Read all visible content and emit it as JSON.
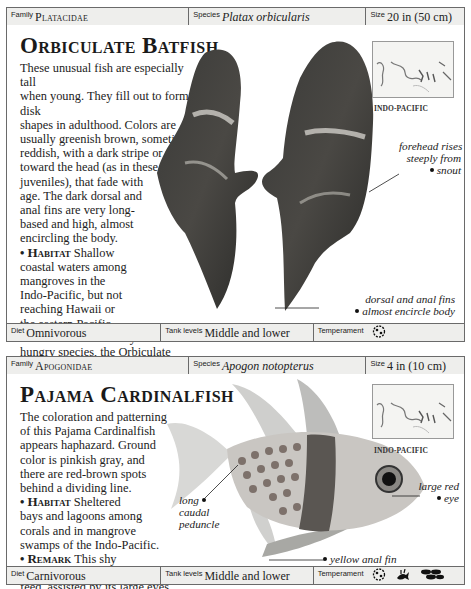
{
  "entries": [
    {
      "header": {
        "family_label": "Family",
        "family_value": "Platacidae",
        "species_label": "Species",
        "species_value": "Platax orbicularis",
        "size_label": "Size",
        "size_value": "20 in (50 cm)"
      },
      "title": "Orbiculate Batfish",
      "description": {
        "intro_lines": [
          "These unusual fish are especially tall",
          "when young. They fill out to form disk",
          "shapes in adulthood. Colors are",
          "usually greenish brown, sometimes",
          "reddish, with a dark stripe or two",
          "toward the head (as in these",
          "juveniles), that fade with",
          "age. The dark dorsal and",
          "anal fins are very long-",
          "based and high, almost",
          "encircling the body."
        ],
        "habitat_heading": "Habitat",
        "habitat_lines": [
          "Shallow",
          "coastal waters among",
          "mangroves in the",
          "Indo-Pacific, but not",
          "reaching Hawaii or",
          "the eastern Pacific."
        ],
        "remark_heading": "Remark",
        "remark_lines": [
          "A constantly",
          "hungry species, the Orbiculate",
          "Batfish grows quickly in the aqua-",
          "rium and needs ample space. In the",
          "wild, it scavenges around pilings and piers."
        ]
      },
      "map_label": "INDO-PACIFIC",
      "annotations": {
        "forehead": [
          "forehead rises",
          "steeply from",
          "snout"
        ],
        "fins": [
          "dorsal and anal fins",
          "almost encircle body"
        ]
      },
      "footer": {
        "diet_label": "Diet",
        "diet_value": "Omnivorous",
        "tank_label": "Tank levels",
        "tank_value": "Middle and lower",
        "temperament_label": "Temperament",
        "temperament_icons": [
          "peaceful-fish-icon"
        ]
      }
    },
    {
      "header": {
        "family_label": "Family",
        "family_value": "Apogonidae",
        "species_label": "Species",
        "species_value": "Apogon notopterus",
        "size_label": "Size",
        "size_value": "4 in (10 cm)"
      },
      "title": "Pajama Cardinalfish",
      "description": {
        "intro_lines": [
          "The coloration and patterning",
          "of this Pajama Cardinalfish",
          "appears haphazard. Ground",
          "color is pinkish gray, and",
          "there are red-brown spots",
          "behind a dividing line."
        ],
        "habitat_heading": "Habitat",
        "habitat_lines": [
          "Sheltered",
          "bays and lagoons among",
          "corals and in mangrove",
          "swamps of the Indo-Pacific."
        ],
        "remark_heading": "Remark",
        "remark_lines": [
          "This shy",
          "species emerges at dusk to",
          "feed, assisted by its large eyes."
        ]
      },
      "map_label": "INDO-PACIFIC",
      "annotations": {
        "eye": [
          "large red",
          "eye"
        ],
        "peduncle": [
          "long",
          "caudal",
          "peduncle"
        ],
        "anal_fin": [
          "yellow anal fin"
        ]
      },
      "footer": {
        "diet_label": "Diet",
        "diet_value": "Carnivorous",
        "tank_label": "Tank levels",
        "tank_value": "Middle and lower",
        "temperament_label": "Temperament",
        "temperament_icons": [
          "peaceful-fish-icon",
          "plant-icon",
          "school-of-fish-icon"
        ]
      }
    }
  ]
}
